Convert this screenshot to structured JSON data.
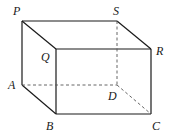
{
  "diagram": {
    "type": "cuboid",
    "vertices": {
      "P": {
        "x": 22,
        "y": 21,
        "label": "P",
        "lx": 13,
        "ly": 15
      },
      "S": {
        "x": 117,
        "y": 21,
        "label": "S",
        "lx": 113,
        "ly": 15
      },
      "Q": {
        "x": 56,
        "y": 49,
        "label": "Q",
        "lx": 41,
        "ly": 61
      },
      "R": {
        "x": 151,
        "y": 49,
        "label": "R",
        "lx": 156,
        "ly": 55
      },
      "A": {
        "x": 22,
        "y": 85,
        "label": "A",
        "lx": 8,
        "ly": 89
      },
      "D": {
        "x": 117,
        "y": 85,
        "label": "D",
        "lx": 108,
        "ly": 100
      },
      "B": {
        "x": 56,
        "y": 114,
        "label": "B",
        "lx": 46,
        "ly": 130
      },
      "C": {
        "x": 151,
        "y": 114,
        "label": "C",
        "lx": 152,
        "ly": 130
      }
    },
    "solid_edges": [
      [
        "P",
        "S"
      ],
      [
        "P",
        "Q"
      ],
      [
        "S",
        "R"
      ],
      [
        "Q",
        "R"
      ],
      [
        "P",
        "A"
      ],
      [
        "Q",
        "B"
      ],
      [
        "R",
        "C"
      ],
      [
        "A",
        "B"
      ],
      [
        "B",
        "C"
      ]
    ],
    "dashed_edges": [
      [
        "A",
        "D"
      ],
      [
        "S",
        "D"
      ],
      [
        "D",
        "C"
      ]
    ],
    "colors": {
      "line": "#1a1a1a",
      "hidden": "#555555",
      "background": "#ffffff"
    }
  }
}
